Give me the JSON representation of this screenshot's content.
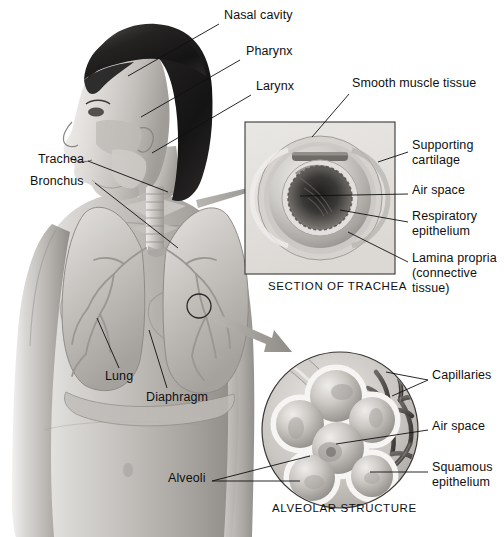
{
  "figure": {
    "title_alt": "Human respiratory system with trachea cross-section and alveolar structure insets",
    "background_color": "#ffffff",
    "ink_color": "#101010"
  },
  "body_labels": [
    {
      "id": "nasal-cavity",
      "text": "Nasal cavity",
      "x": 224,
      "y": 14,
      "leader": [
        [
          218,
          24
        ],
        [
          128,
          76
        ]
      ]
    },
    {
      "id": "pharynx",
      "text": "Pharynx",
      "x": 246,
      "y": 50,
      "leader": [
        [
          240,
          60
        ],
        [
          140,
          116
        ]
      ]
    },
    {
      "id": "larynx",
      "text": "Larynx",
      "x": 256,
      "y": 85,
      "leader": [
        [
          250,
          95
        ],
        [
          152,
          152
        ]
      ]
    },
    {
      "id": "trachea",
      "text": "Trachea",
      "x": 38,
      "y": 158,
      "leader": [
        [
          88,
          164
        ],
        [
          168,
          192
        ]
      ]
    },
    {
      "id": "bronchus",
      "text": "Bronchus",
      "x": 30,
      "y": 180,
      "leader": [
        [
          93,
          186
        ],
        [
          176,
          246
        ]
      ]
    },
    {
      "id": "lung",
      "text": "Lung",
      "x": 105,
      "y": 375,
      "leader": [
        [
          118,
          370
        ],
        [
          96,
          318
        ]
      ]
    },
    {
      "id": "diaphragm",
      "text": "Diaphragm",
      "x": 146,
      "y": 396,
      "leader": [
        [
          165,
          390
        ],
        [
          148,
          330
        ]
      ]
    }
  ],
  "trachea_inset": {
    "caption": "SECTION OF TRACHEA",
    "caption_x": 268,
    "caption_y": 286,
    "panel": {
      "x": 245,
      "y": 122,
      "w": 150,
      "h": 152
    },
    "labels": [
      {
        "id": "smooth-muscle-tissue",
        "text": "Smooth muscle tissue",
        "x": 352,
        "y": 82,
        "lines": 1,
        "leader": [
          [
            350,
            95
          ],
          [
            312,
            136
          ]
        ]
      },
      {
        "id": "supporting-cartilage",
        "text": "Supporting\ncartilage",
        "x": 412,
        "y": 144,
        "lines": 2,
        "leader": [
          [
            408,
            152
          ],
          [
            360,
            167
          ]
        ]
      },
      {
        "id": "air-space",
        "text": "Air space",
        "x": 412,
        "y": 189,
        "lines": 1,
        "leader": [
          [
            408,
            194
          ],
          [
            300,
            194
          ]
        ]
      },
      {
        "id": "respiratory-epithelium",
        "text": "Respiratory\nepithelium",
        "x": 412,
        "y": 215,
        "lines": 2,
        "leader": [
          [
            408,
            222
          ],
          [
            330,
            208
          ]
        ]
      },
      {
        "id": "lamina-propria",
        "text": "Lamina propria\n(connective\ntissue)",
        "x": 412,
        "y": 257,
        "lines": 3,
        "leader": [
          [
            408,
            262
          ],
          [
            344,
            228
          ]
        ]
      }
    ]
  },
  "alveolar_inset": {
    "caption": "ALVEOLAR STRUCTURE",
    "caption_x": 272,
    "caption_y": 508,
    "circle": {
      "cx": 340,
      "cy": 430,
      "r": 78
    },
    "labels": [
      {
        "id": "capillaries",
        "text": "Capillaries",
        "x": 432,
        "y": 374,
        "lines": 1,
        "leader": [
          [
            428,
            380
          ],
          [
            392,
            386
          ]
        ]
      },
      {
        "id": "alveolar-air-space",
        "text": "Air space",
        "x": 432,
        "y": 425,
        "lines": 1,
        "leader": [
          [
            428,
            430
          ],
          [
            330,
            438
          ]
        ]
      },
      {
        "id": "squamous-epithelium",
        "text": "Squamous\nepithelium",
        "x": 432,
        "y": 466,
        "lines": 2,
        "leader": [
          [
            428,
            472
          ],
          [
            372,
            470
          ]
        ]
      },
      {
        "id": "alveoli",
        "text": "Alveoli",
        "x": 168,
        "y": 477,
        "lines": 1,
        "leader": [
          [
            212,
            483
          ],
          [
            300,
            460
          ]
        ]
      }
    ]
  },
  "arrows": [
    {
      "id": "arrow-to-trachea-section",
      "from": [
        200,
        195
      ],
      "to": [
        272,
        178
      ]
    },
    {
      "id": "arrow-to-alveolar-structure",
      "from": [
        222,
        318
      ],
      "to": [
        288,
        362
      ]
    }
  ],
  "lung_marker": {
    "id": "lung-callout-circle",
    "cx": 199,
    "cy": 306,
    "r": 12
  }
}
